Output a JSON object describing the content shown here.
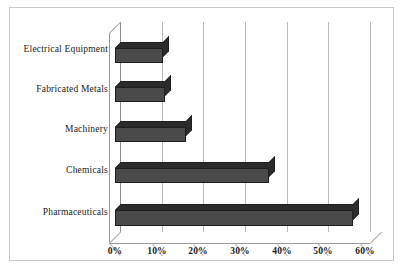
{
  "chart_data": {
    "type": "bar",
    "orientation": "horizontal",
    "title": "",
    "subtitle": "",
    "xlabel": "",
    "ylabel": "",
    "categories": [
      "Electrical Equipment",
      "Fabricated Metals",
      "Machinery",
      "Chemicals",
      "Pharmaceuticals"
    ],
    "values": [
      11.5,
      12,
      17,
      37,
      57
    ],
    "value_suffix": "%",
    "xlim": [
      0,
      60
    ],
    "xticks": [
      0,
      10,
      20,
      30,
      40,
      50,
      60
    ],
    "xtick_labels": [
      "0%",
      "10%",
      "20%",
      "30%",
      "40%",
      "50%",
      "60%"
    ],
    "grid": true,
    "grid_axis": "x",
    "legend": false,
    "legend_position": "none",
    "style": "3d",
    "series": [
      {
        "name": "Share",
        "color": "#4a4a4a",
        "values": [
          11.5,
          12,
          17,
          37,
          57
        ]
      }
    ]
  },
  "colors": {
    "bar_face": "#4a4a4a",
    "bar_shade": "#2b2b2b",
    "bar_edge": "#1e1e1e",
    "gridline": "#b9b9b9",
    "axis": "#9a9a9a",
    "frame": "#c9c9c9",
    "background": "#ffffff",
    "text": "#1a1a1a"
  }
}
